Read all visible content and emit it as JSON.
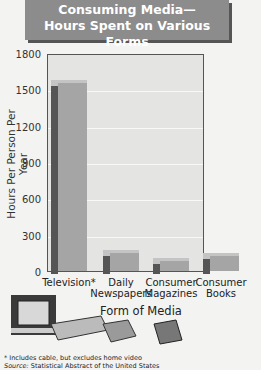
{
  "title": {
    "line1": "Consuming Media—",
    "line2": "Hours Spent on Various Forms"
  },
  "footnotes": {
    "note": "* Includes cable, but excludes home video",
    "source_label": "Source:",
    "source": "Statistical Abstract of the United States"
  },
  "chart_data": {
    "type": "bar",
    "xlabel": "Form of Media",
    "ylabel": "Hours Per Person Per Year",
    "categories": [
      "Television*",
      "Daily Newspapers",
      "Consumer Magazines",
      "Consumer Books"
    ],
    "values": [
      1550,
      150,
      80,
      120
    ],
    "yticks": [
      0,
      300,
      600,
      900,
      1200,
      1500,
      1800
    ],
    "ylim": [
      0,
      1800
    ],
    "grid": true,
    "legend": null,
    "style": "3d-bar",
    "bar_color": "#a5a5a5"
  },
  "ylabels": [
    "0",
    "300",
    "600",
    "900",
    "1200",
    "1500",
    "1800"
  ],
  "xlabels": [
    {
      "l1": "Television*",
      "l2": ""
    },
    {
      "l1": "Daily",
      "l2": "Newspapers"
    },
    {
      "l1": "Consumer",
      "l2": "Magazines"
    },
    {
      "l1": "Consumer",
      "l2": "Books"
    }
  ]
}
